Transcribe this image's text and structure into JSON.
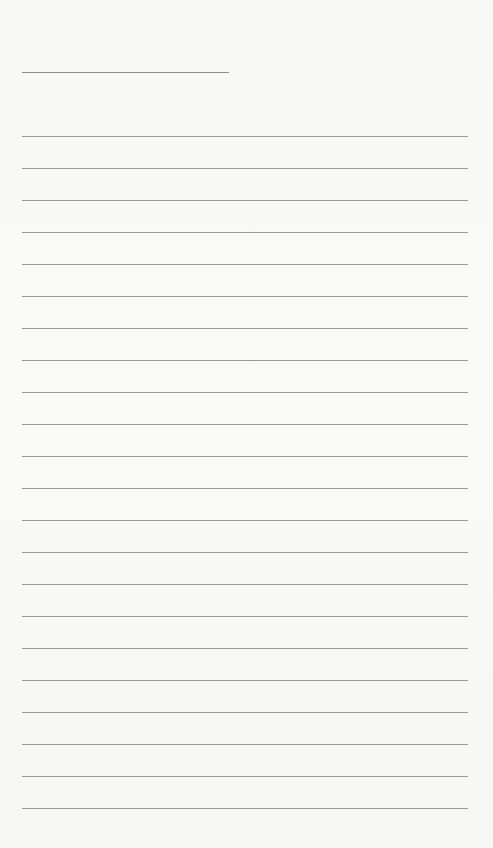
{
  "document": {
    "type": "lined-paper",
    "header_line": {
      "present": true
    },
    "ruled_lines": {
      "count": 22,
      "first_y": 136,
      "spacing": 32
    },
    "colors": {
      "paper": "#f9f9f8",
      "line": "#9a9a9a"
    }
  }
}
